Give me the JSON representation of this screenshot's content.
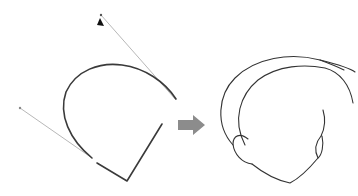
{
  "figure": {
    "left_panel": {
      "label": "bezier-curve-with-handles",
      "elements": [
        "main-curve",
        "upper-handle-line",
        "lower-handle-line",
        "anchor-segment",
        "pen-cursor"
      ]
    },
    "arrow": {
      "direction": "right",
      "color": "#8c8c8c"
    },
    "right_panel": {
      "label": "head-outline-drawing",
      "elements": [
        "hair-outer-curve",
        "hair-inner-curve",
        "face-outline",
        "left-ear",
        "right-ear"
      ]
    },
    "colors": {
      "background": "#ffffff",
      "stroke": "#3a3a3a",
      "handle": "#b8b8b8",
      "arrow": "#8c8c8c"
    }
  }
}
